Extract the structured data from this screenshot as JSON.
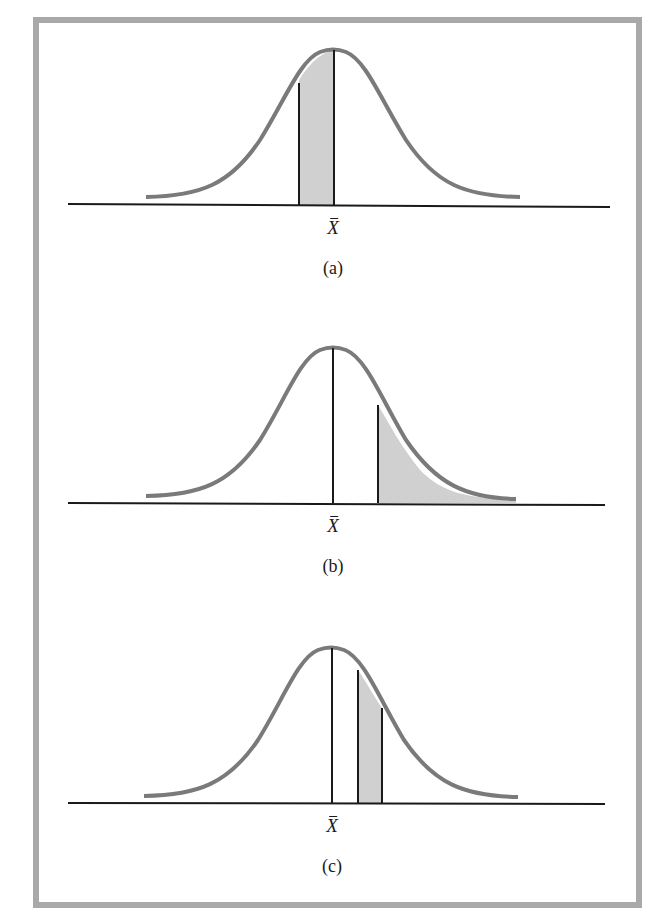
{
  "figure": {
    "panels": [
      {
        "id": "a",
        "caption": "(a)",
        "axis_label": "X",
        "shaded_region": "between a point left of the mean and the mean"
      },
      {
        "id": "b",
        "caption": "(b)",
        "axis_label": "X",
        "shaded_region": "right tail beyond a point above the mean"
      },
      {
        "id": "c",
        "caption": "(c)",
        "axis_label": "X",
        "shaded_region": "between two points above the mean"
      }
    ]
  },
  "colors": {
    "curve": "#7a7a7a",
    "shade": "#d0d0d0",
    "frame": "#a9a9a9",
    "lines": "#1a1a1a"
  }
}
